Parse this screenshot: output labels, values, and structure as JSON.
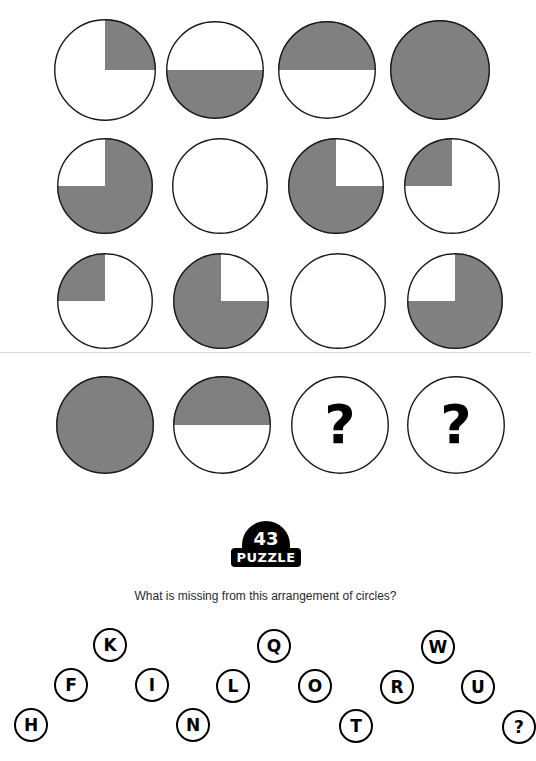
{
  "puzzle": {
    "badge_number": "43",
    "badge_word": "PUZZLE",
    "question": "What is missing from this arrangement of circles?",
    "shaded_color": "#808080",
    "outline_color": "#1a1a1a",
    "background_color": "#ffffff",
    "rule_color": "#d8d8d8",
    "question_mark": "?"
  },
  "grid": {
    "rows": 4,
    "columns": 4,
    "cells": [
      {
        "id": "r1c1",
        "row": 1,
        "col": 1,
        "cx": 105,
        "cy": 70,
        "r": 51,
        "fill": "quarter-top-right",
        "label": "one quarter shaded (top-right)"
      },
      {
        "id": "r1c2",
        "row": 1,
        "col": 2,
        "cx": 215,
        "cy": 70,
        "r": 49,
        "fill": "half-bottom",
        "label": "bottom half shaded"
      },
      {
        "id": "r1c3",
        "row": 1,
        "col": 3,
        "cx": 327,
        "cy": 70,
        "r": 49,
        "fill": "half-top",
        "label": "top half shaded"
      },
      {
        "id": "r1c4",
        "row": 1,
        "col": 4,
        "cx": 440,
        "cy": 70,
        "r": 50,
        "fill": "full",
        "label": "fully shaded"
      },
      {
        "id": "r2c1",
        "row": 2,
        "col": 1,
        "cx": 105,
        "cy": 186,
        "r": 48,
        "fill": "three-quarter-except-top-left",
        "label": "three quarters shaded (top-left blank)"
      },
      {
        "id": "r2c2",
        "row": 2,
        "col": 2,
        "cx": 220,
        "cy": 186,
        "r": 48,
        "fill": "empty",
        "label": "unshaded"
      },
      {
        "id": "r2c3",
        "row": 2,
        "col": 3,
        "cx": 336,
        "cy": 186,
        "r": 48,
        "fill": "three-quarter-except-top-right",
        "label": "three quarters shaded (top-right blank)"
      },
      {
        "id": "r2c4",
        "row": 2,
        "col": 4,
        "cx": 452,
        "cy": 186,
        "r": 48,
        "fill": "quarter-top-left",
        "label": "one quarter shaded (top-left)"
      },
      {
        "id": "r3c1",
        "row": 3,
        "col": 1,
        "cx": 105,
        "cy": 301,
        "r": 48,
        "fill": "quarter-top-left",
        "label": "one quarter shaded (top-left)"
      },
      {
        "id": "r3c2",
        "row": 3,
        "col": 2,
        "cx": 221,
        "cy": 301,
        "r": 48,
        "fill": "three-quarter-except-top-right",
        "label": "three quarters shaded (top-right blank)"
      },
      {
        "id": "r3c3",
        "row": 3,
        "col": 3,
        "cx": 338,
        "cy": 301,
        "r": 48,
        "fill": "empty",
        "label": "unshaded"
      },
      {
        "id": "r3c4",
        "row": 3,
        "col": 4,
        "cx": 455,
        "cy": 301,
        "r": 48,
        "fill": "three-quarter-except-top-left",
        "label": "three quarters shaded (top-left blank)"
      },
      {
        "id": "r4c1",
        "row": 4,
        "col": 1,
        "cx": 105,
        "cy": 425,
        "r": 49,
        "fill": "full",
        "label": "fully shaded"
      },
      {
        "id": "r4c2",
        "row": 4,
        "col": 2,
        "cx": 222,
        "cy": 425,
        "r": 49,
        "fill": "half-top",
        "label": "top half shaded"
      },
      {
        "id": "r4c3",
        "row": 4,
        "col": 3,
        "cx": 340,
        "cy": 425,
        "r": 49,
        "fill": "question",
        "label": "missing - question mark"
      },
      {
        "id": "r4c4",
        "row": 4,
        "col": 4,
        "cx": 456,
        "cy": 425,
        "r": 49,
        "fill": "question",
        "label": "missing - question mark"
      }
    ]
  },
  "rule_y": 352,
  "answers": [
    {
      "label": "H",
      "cx": 31,
      "cy": 105
    },
    {
      "label": "F",
      "cx": 71,
      "cy": 65
    },
    {
      "label": "K",
      "cx": 110,
      "cy": 25
    },
    {
      "label": "I",
      "cx": 152,
      "cy": 65
    },
    {
      "label": "N",
      "cx": 193,
      "cy": 105
    },
    {
      "label": "L",
      "cx": 233,
      "cy": 66
    },
    {
      "label": "Q",
      "cx": 274,
      "cy": 26
    },
    {
      "label": "O",
      "cx": 315,
      "cy": 66
    },
    {
      "label": "T",
      "cx": 356,
      "cy": 106
    },
    {
      "label": "R",
      "cx": 397,
      "cy": 67
    },
    {
      "label": "W",
      "cx": 438,
      "cy": 27
    },
    {
      "label": "U",
      "cx": 478,
      "cy": 67
    },
    {
      "label": "?",
      "cx": 519,
      "cy": 107
    }
  ]
}
